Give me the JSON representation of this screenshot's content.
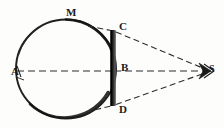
{
  "figure": {
    "background_color": "#fdfdfc",
    "ink_color": "#1a1a1a",
    "labels": {
      "left_point": "A",
      "top_point": "M",
      "bar_top": "C",
      "bar_center": "B",
      "bar_bottom": "D",
      "convergence_point": "S"
    },
    "elements": {
      "circle_name": "circle-outline",
      "bar_name": "vertical-bar-CD",
      "axis_name": "horizontal-axis-AB",
      "ray_upper_name": "dashed-ray-C-to-S",
      "ray_lower_name": "dashed-ray-D-to-S",
      "ray_tangent_upper_name": "dashed-tangent-upper",
      "ray_tangent_lower_name": "dashed-tangent-lower"
    },
    "geometry": {
      "circle_center_x": 66,
      "circle_center_y": 69,
      "circle_radius": 50,
      "bar_x": 113,
      "bar_top_y": 30,
      "bar_bottom_y": 106,
      "convergence_x": 207,
      "convergence_y": 71
    }
  }
}
